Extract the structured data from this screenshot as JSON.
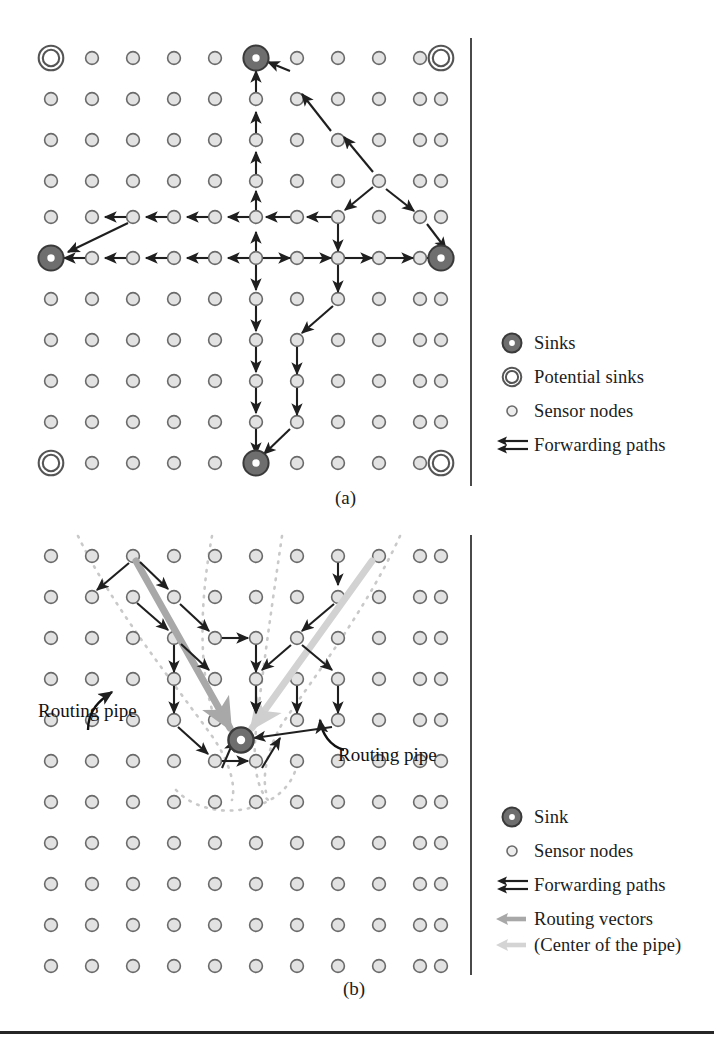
{
  "figure": {
    "panel_a_caption": "(a)",
    "panel_b_caption": "(b)"
  },
  "colors": {
    "sink_fill": "#6e6e6e",
    "sink_stroke": "#3a3a3a",
    "sink_center": "#ffffff",
    "node_fill": "#e2e2e2",
    "node_stroke": "#6a6a6a",
    "potential_stroke": "#555555",
    "arrow_dark": "#1f1f1f",
    "routing_vector": "#a8a8a8",
    "pipe_dotted": "#c9c9c9",
    "divider": "#4a4a4a",
    "rule": "#262626"
  },
  "panel_a": {
    "grid": {
      "cols": 11,
      "rows": 11,
      "x0": 51,
      "y0": 58,
      "dx": 41,
      "dy": 41
    },
    "sinks": [
      [
        5,
        0
      ],
      [
        0,
        5
      ],
      [
        10,
        5
      ],
      [
        5,
        10
      ]
    ],
    "potential_sinks": [
      [
        0,
        0
      ],
      [
        10,
        0
      ],
      [
        0,
        10
      ],
      [
        10,
        10
      ]
    ],
    "legend": {
      "items": [
        {
          "symbol": "sink-marker",
          "label": "Sinks"
        },
        {
          "symbol": "potential-sink-marker",
          "label": "Potential sinks"
        },
        {
          "symbol": "sensor-node-marker",
          "label": "Sensor nodes"
        },
        {
          "symbol": "forwarding-arrows",
          "label": "Forwarding paths"
        }
      ]
    }
  },
  "panel_b": {
    "grid": {
      "cols": 11,
      "rows": 11,
      "x0": 51,
      "y0": 556,
      "dx": 41,
      "dy": 41
    },
    "sink": [
      5,
      4
    ],
    "annotations": [
      {
        "name": "routing-pipe-left",
        "text": "Routing pipe",
        "x": 38,
        "y": 712
      },
      {
        "name": "routing-pipe-right",
        "text": "Routing pipe",
        "x": 338,
        "y": 752
      }
    ],
    "legend": {
      "items": [
        {
          "symbol": "sink-marker",
          "label": "Sink"
        },
        {
          "symbol": "sensor-node-marker",
          "label": "Sensor nodes"
        },
        {
          "symbol": "forwarding-arrows",
          "label": "Forwarding paths"
        },
        {
          "symbol": "routing-vector-arrow",
          "label": "Routing vectors"
        },
        {
          "symbol": "routing-vector-arrow-light",
          "label": "(Center of the pipe)"
        }
      ]
    }
  }
}
